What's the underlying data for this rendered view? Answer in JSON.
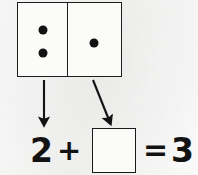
{
  "worksheet": {
    "title": "Domino addition problem",
    "background_color": "#f5f5f4",
    "ink_color": "#121212"
  },
  "domino": {
    "name": "domino-tile",
    "left_cell": {
      "label": "left-half",
      "pip_count": 2,
      "pips": [
        "pip",
        "pip"
      ]
    },
    "right_cell": {
      "label": "right-half",
      "pip_count": 1,
      "pips": [
        "pip"
      ]
    }
  },
  "arrows": [
    {
      "name": "arrow-from-left-half",
      "direction": "down",
      "points_to": "addend-2"
    },
    {
      "name": "arrow-from-right-half",
      "direction": "down-right",
      "points_to": "answer-box"
    }
  ],
  "equation": {
    "addend": "2",
    "operator": "+",
    "missing_addend": "",
    "equals": "=",
    "sum": "3",
    "full_text": "2 + ☐ = 3"
  }
}
